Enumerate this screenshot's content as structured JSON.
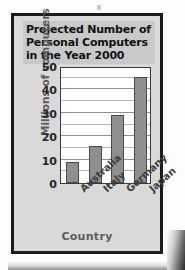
{
  "figure": {
    "frame_color": "#1b1b1b",
    "panel_color": "#d9d9d9",
    "title_band_color": "#c9c9c9",
    "bar_color": "#8f8f8f",
    "plot_bg": "#ffffff",
    "axis_label_color": "#5d5d5d"
  },
  "title": {
    "line1": "Projected Number of",
    "line2": "Personal Computers",
    "line3": "in the Year 2000",
    "full": "Projected Number of Personal Computers in the Year 2000"
  },
  "chart_data": {
    "type": "bar",
    "title": "Projected Number of Personal Computers in the Year 2000",
    "categories": [
      "Australia",
      "Italy",
      "Germany",
      "Japan"
    ],
    "values": [
      9,
      16,
      29,
      45.5
    ],
    "xlabel": "Country",
    "ylabel": "Millions of computers",
    "ylim": [
      0,
      50
    ],
    "yticks": [
      0,
      10,
      20,
      30,
      40,
      50
    ],
    "ytick_labels": [
      "0",
      "10",
      "20",
      "30",
      "40",
      "50"
    ],
    "minor_gridlines": [
      5,
      15,
      25,
      35,
      45
    ],
    "grid": true,
    "grid_axis": "y",
    "legend": null,
    "series": [
      {
        "name": "Millions of computers",
        "values": [
          9,
          16,
          29,
          45.5
        ]
      }
    ]
  }
}
